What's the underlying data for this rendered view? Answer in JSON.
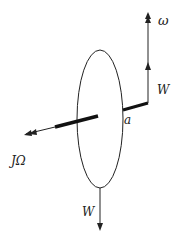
{
  "diagram": {
    "labels": {
      "omega": "ω",
      "weight_top": "W",
      "arm": "a",
      "angular_momentum": "JΩ",
      "weight_bottom": "W"
    },
    "colors": {
      "stroke": "#222222",
      "background": "#ffffff"
    }
  }
}
